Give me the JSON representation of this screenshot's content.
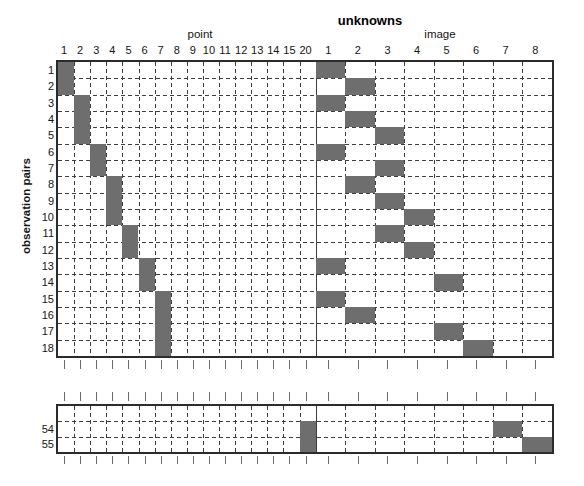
{
  "title": "unknowns",
  "group_labels": {
    "point": "point",
    "image": "image"
  },
  "y_axis_label": "observation pairs",
  "columns": {
    "point": [
      "1",
      "2",
      "3",
      "4",
      "5",
      "6",
      "7",
      "8",
      "9",
      "10",
      "11",
      "12",
      "13",
      "14",
      "15",
      "20"
    ],
    "image": [
      "1",
      "2",
      "3",
      "4",
      "5",
      "6",
      "7",
      "8"
    ]
  },
  "colors": {
    "filled_cell": "#6e6e6e",
    "grid_line": "#3d3d3d",
    "frame": "#2b2b2b",
    "background": "#ffffff",
    "text": "#141414"
  },
  "chart_data": {
    "type": "heatmap",
    "title": "unknowns",
    "xlabel": "",
    "ylabel": "observation pairs",
    "grid": true,
    "legend": null,
    "column_groups": [
      {
        "name": "point",
        "labels": [
          "1",
          "2",
          "3",
          "4",
          "5",
          "6",
          "7",
          "8",
          "9",
          "10",
          "11",
          "12",
          "13",
          "14",
          "15",
          "20"
        ]
      },
      {
        "name": "image",
        "labels": [
          "1",
          "2",
          "3",
          "4",
          "5",
          "6",
          "7",
          "8"
        ]
      }
    ],
    "top_block": {
      "row_labels": [
        "1",
        "2",
        "3",
        "4",
        "5",
        "6",
        "7",
        "8",
        "9",
        "10",
        "11",
        "12",
        "13",
        "14",
        "15",
        "16",
        "17",
        "18"
      ],
      "filled": [
        {
          "row": "1",
          "point_col": 1,
          "image_col": 1
        },
        {
          "row": "2",
          "point_col": 1,
          "image_col": 2
        },
        {
          "row": "3",
          "point_col": 2,
          "image_col": 1
        },
        {
          "row": "4",
          "point_col": 2,
          "image_col": 2
        },
        {
          "row": "5",
          "point_col": 2,
          "image_col": 3
        },
        {
          "row": "6",
          "point_col": 3,
          "image_col": 1
        },
        {
          "row": "7",
          "point_col": 3,
          "image_col": 3
        },
        {
          "row": "8",
          "point_col": 4,
          "image_col": 2
        },
        {
          "row": "9",
          "point_col": 4,
          "image_col": 3
        },
        {
          "row": "10",
          "point_col": 4,
          "image_col": 4
        },
        {
          "row": "11",
          "point_col": 5,
          "image_col": 3
        },
        {
          "row": "12",
          "point_col": 5,
          "image_col": 4
        },
        {
          "row": "13",
          "point_col": 6,
          "image_col": 1
        },
        {
          "row": "14",
          "point_col": 6,
          "image_col": 5
        },
        {
          "row": "15",
          "point_col": 7,
          "image_col": 1
        },
        {
          "row": "16",
          "point_col": 7,
          "image_col": 2
        },
        {
          "row": "17",
          "point_col": 7,
          "image_col": 5
        },
        {
          "row": "18",
          "point_col": 7,
          "image_col": 6
        }
      ]
    },
    "bottom_block": {
      "row_labels": [
        "",
        "54",
        "55"
      ],
      "filled": [
        {
          "row": "54",
          "point_col": 16,
          "image_col": 7
        },
        {
          "row": "55",
          "point_col": 16,
          "image_col": 8
        }
      ]
    }
  }
}
